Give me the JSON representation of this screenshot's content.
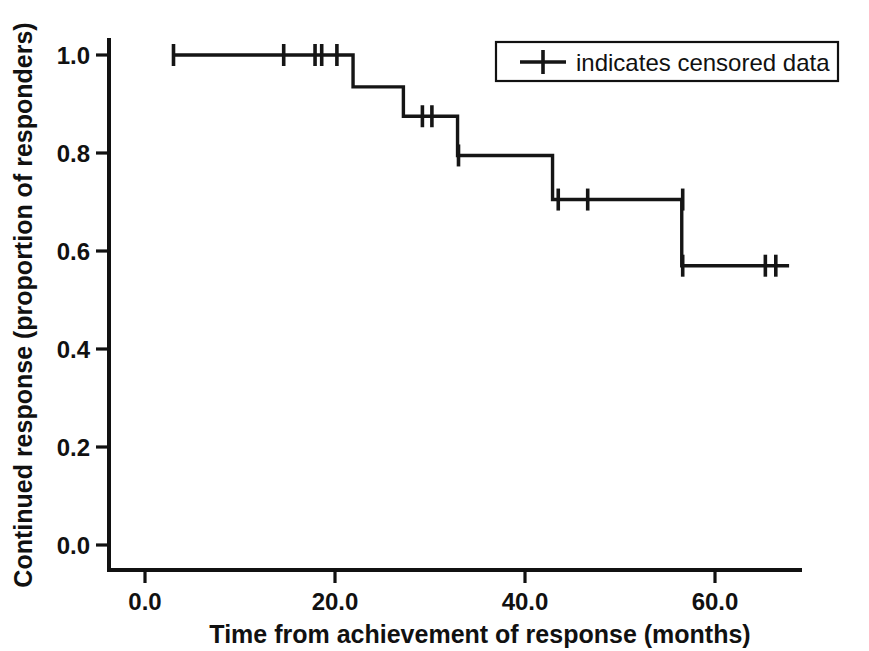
{
  "chart_data": {
    "type": "line",
    "subtype": "kaplan-meier-step",
    "title": "",
    "xlabel": "Time from achievement of response (months)",
    "ylabel": "Continued response (proportion of responders)",
    "xlim": [
      -2,
      70
    ],
    "ylim": [
      0.0,
      1.05
    ],
    "xticks": [
      0.0,
      20.0,
      40.0,
      60.0
    ],
    "xtick_labels": [
      "0.0",
      "20.0",
      "40.0",
      "60.0"
    ],
    "yticks": [
      0.0,
      0.2,
      0.4,
      0.6,
      0.8,
      1.0
    ],
    "ytick_labels": [
      "0.0",
      "0.2",
      "0.4",
      "0.6",
      "0.8",
      "1.0"
    ],
    "grid": false,
    "legend_position": "top-right",
    "legend": [
      {
        "marker": "line-with-cross-tick",
        "label": "indicates censored data"
      }
    ],
    "series": [
      {
        "name": "Continued response",
        "color": "#151515",
        "steps": [
          {
            "time": 3.0,
            "survival": 1.0
          },
          {
            "time": 21.9,
            "survival": 1.0
          },
          {
            "time": 21.9,
            "survival": 0.935
          },
          {
            "time": 27.2,
            "survival": 0.935
          },
          {
            "time": 27.2,
            "survival": 0.875
          },
          {
            "time": 32.9,
            "survival": 0.875
          },
          {
            "time": 32.9,
            "survival": 0.795
          },
          {
            "time": 42.9,
            "survival": 0.795
          },
          {
            "time": 42.9,
            "survival": 0.705
          },
          {
            "time": 56.5,
            "survival": 0.705
          },
          {
            "time": 56.5,
            "survival": 0.57
          },
          {
            "time": 67.8,
            "survival": 0.57
          }
        ],
        "censored": [
          {
            "time": 3.0,
            "survival": 1.0
          },
          {
            "time": 14.6,
            "survival": 1.0
          },
          {
            "time": 17.9,
            "survival": 1.0
          },
          {
            "time": 18.6,
            "survival": 1.0
          },
          {
            "time": 20.2,
            "survival": 1.0
          },
          {
            "time": 29.2,
            "survival": 0.875
          },
          {
            "time": 30.2,
            "survival": 0.875
          },
          {
            "time": 33.0,
            "survival": 0.795
          },
          {
            "time": 43.5,
            "survival": 0.705
          },
          {
            "time": 46.6,
            "survival": 0.705
          },
          {
            "time": 56.6,
            "survival": 0.705
          },
          {
            "time": 56.6,
            "survival": 0.57
          },
          {
            "time": 65.3,
            "survival": 0.57
          },
          {
            "time": 66.4,
            "survival": 0.57
          }
        ]
      }
    ]
  },
  "figure": {
    "background_color": "#ffffff",
    "axis_color": "#111111",
    "line_color": "#151515"
  }
}
